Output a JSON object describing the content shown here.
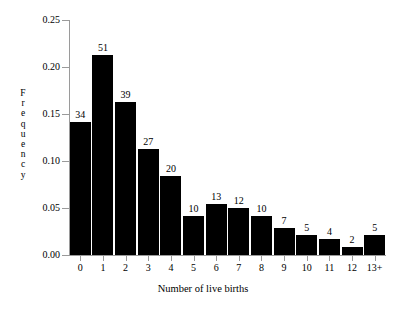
{
  "chart_data": {
    "type": "bar",
    "title": "",
    "xlabel": "Number of live births",
    "ylabel": "Frequency",
    "categories": [
      "0",
      "1",
      "2",
      "3",
      "4",
      "5",
      "6",
      "7",
      "8",
      "9",
      "10",
      "11",
      "12",
      "13+"
    ],
    "counts": [
      34,
      51,
      39,
      27,
      20,
      10,
      13,
      12,
      10,
      7,
      5,
      4,
      2,
      5
    ],
    "values": [
      0.142,
      0.213,
      0.163,
      0.113,
      0.084,
      0.042,
      0.054,
      0.05,
      0.042,
      0.029,
      0.021,
      0.017,
      0.008,
      0.021
    ],
    "total_count": 239,
    "ylim": [
      0.0,
      0.25
    ],
    "yticks": [
      "0.00",
      "0.05",
      "0.10",
      "0.15",
      "0.20",
      "0.25"
    ],
    "ytick_values": [
      0.0,
      0.05,
      0.1,
      0.15,
      0.2,
      0.25
    ],
    "grid": false,
    "legend": "none",
    "bar_color": "#000000",
    "axis_color": "#9a9a9a",
    "background_color": "#ffffff",
    "bar_labels_show_counts": true
  },
  "ylabel_letters": [
    "F",
    "r",
    "e",
    "q",
    "u",
    "e",
    "n",
    "c",
    "y"
  ]
}
